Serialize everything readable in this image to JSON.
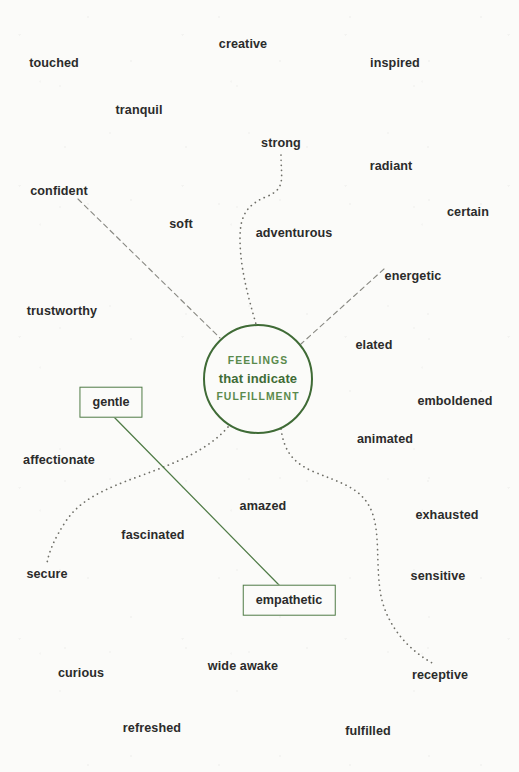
{
  "canvas": {
    "width": 519,
    "height": 772,
    "background_color": "#fbfbf9",
    "text_color": "#2b2b2b",
    "accent_green": "#4f7b46",
    "hub_green_dark": "#3f6b36",
    "hub_green_light": "#5a8a4c",
    "dash_gray": "#8a8a84",
    "dot_gray": "#6f6f68"
  },
  "hub": {
    "line1": "FEELINGS",
    "line2": "that indicate",
    "line3": "FULFILLMENT",
    "cx": 258,
    "cy": 379,
    "diameter": 110
  },
  "words": [
    {
      "label": "creative",
      "x": 243,
      "y": 44
    },
    {
      "label": "touched",
      "x": 54,
      "y": 63
    },
    {
      "label": "inspired",
      "x": 395,
      "y": 63
    },
    {
      "label": "tranquil",
      "x": 139,
      "y": 110
    },
    {
      "label": "strong",
      "x": 281,
      "y": 143
    },
    {
      "label": "radiant",
      "x": 391,
      "y": 166
    },
    {
      "label": "confident",
      "x": 59,
      "y": 191
    },
    {
      "label": "certain",
      "x": 468,
      "y": 212
    },
    {
      "label": "soft",
      "x": 181,
      "y": 224
    },
    {
      "label": "adventurous",
      "x": 294,
      "y": 233
    },
    {
      "label": "energetic",
      "x": 413,
      "y": 276
    },
    {
      "label": "trustworthy",
      "x": 62,
      "y": 311
    },
    {
      "label": "elated",
      "x": 374,
      "y": 345
    },
    {
      "label": "emboldened",
      "x": 455,
      "y": 401
    },
    {
      "label": "animated",
      "x": 385,
      "y": 439
    },
    {
      "label": "affectionate",
      "x": 59,
      "y": 460
    },
    {
      "label": "amazed",
      "x": 263,
      "y": 506
    },
    {
      "label": "exhausted",
      "x": 447,
      "y": 515
    },
    {
      "label": "fascinated",
      "x": 153,
      "y": 535
    },
    {
      "label": "secure",
      "x": 47,
      "y": 574
    },
    {
      "label": "sensitive",
      "x": 438,
      "y": 576
    },
    {
      "label": "wide awake",
      "x": 243,
      "y": 666
    },
    {
      "label": "curious",
      "x": 81,
      "y": 673
    },
    {
      "label": "receptive",
      "x": 440,
      "y": 675
    },
    {
      "label": "refreshed",
      "x": 152,
      "y": 728
    },
    {
      "label": "fulfilled",
      "x": 368,
      "y": 731
    }
  ],
  "highlighted_words": [
    {
      "label": "gentle",
      "x": 111,
      "y": 402
    },
    {
      "label": "empathetic",
      "x": 289,
      "y": 600
    }
  ],
  "connectors": [
    {
      "name": "confident-to-hub",
      "style": "dashed",
      "from": "confident",
      "to": "hub"
    },
    {
      "name": "strong-to-hub",
      "style": "dotted",
      "from": "strong",
      "to": "hub"
    },
    {
      "name": "energetic-to-hub",
      "style": "dashed",
      "from": "energetic",
      "to": "hub"
    },
    {
      "name": "secure-to-hub",
      "style": "dotted",
      "from": "secure",
      "to": "hub"
    },
    {
      "name": "receptive-to-hub",
      "style": "dotted",
      "from": "receptive",
      "to": "hub"
    },
    {
      "name": "gentle-to-empathetic",
      "style": "solid",
      "from": "gentle",
      "to": "empathetic"
    }
  ]
}
